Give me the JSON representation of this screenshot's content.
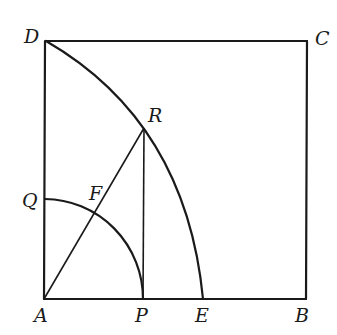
{
  "diagram": {
    "type": "geometry",
    "points": {
      "A": {
        "label": "A",
        "x": 44,
        "y": 299
      },
      "B": {
        "label": "B",
        "x": 306,
        "y": 299
      },
      "C": {
        "label": "C",
        "x": 307,
        "y": 41
      },
      "D": {
        "label": "D",
        "x": 46,
        "y": 41
      },
      "E": {
        "label": "E",
        "x": 203,
        "y": 299
      },
      "P": {
        "label": "P",
        "x": 143,
        "y": 299
      },
      "Q": {
        "label": "Q",
        "x": 45,
        "y": 199
      },
      "R": {
        "label": "R",
        "x": 144,
        "y": 128
      },
      "F": {
        "label": "F",
        "x": 96,
        "y": 212
      }
    },
    "labels": {
      "A": "A",
      "B": "B",
      "C": "C",
      "D": "D",
      "E": "E",
      "P": "P",
      "Q": "Q",
      "R": "R",
      "F": "F"
    },
    "segments": [
      "AB",
      "BC",
      "CD",
      "DA",
      "AR",
      "RP"
    ],
    "arcs": [
      "DRE (center A)",
      "QFP (center A)"
    ]
  }
}
